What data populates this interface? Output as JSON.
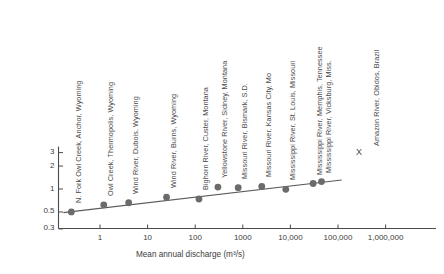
{
  "chart_data": {
    "type": "scatter",
    "title": "",
    "xlabel": "Mean annual discharge (m³/s)",
    "ylabel": "Mean velocity (m/s)",
    "xscale": "log",
    "yscale": "log",
    "xlim": [
      0.15,
      3000000
    ],
    "ylim": [
      0.3,
      3
    ],
    "grid": false,
    "legend_position": "inside-right",
    "xticks": [
      1,
      10,
      100,
      1000,
      10000,
      100000,
      1000000
    ],
    "xticklabels": [
      "1",
      "10",
      "100",
      "1000",
      "10,000",
      "100,000",
      "1,000,000"
    ],
    "yticks": [
      0.3,
      0.5,
      1,
      2,
      3
    ],
    "yticklabels": [
      "0.3",
      "0.5",
      "1",
      "2",
      "3"
    ],
    "marker": "filled-circle",
    "marker_color": "#6b6b6b",
    "line_color": "#5a5a5a",
    "trendline": {
      "label": "fitted power law",
      "x_start": 0.17,
      "y_start": 0.49,
      "x_end": 120000,
      "y_end": 1.31
    },
    "points": [
      {
        "label": "N. Fork Owl Creek, Anchor, Wyoming",
        "x": 0.25,
        "y": 0.5
      },
      {
        "label": "Owl Creek, Thermopolis, Wyoming",
        "x": 1.2,
        "y": 0.62
      },
      {
        "label": "Wind River, Dubois, Wyoming",
        "x": 4.0,
        "y": 0.66
      },
      {
        "label": "Wind River, Burns, Wyoming",
        "x": 25,
        "y": 0.78
      },
      {
        "label": "Bighorn River, Custer, Montana",
        "x": 120,
        "y": 0.74
      },
      {
        "label": "Yellowstone River, Sidney, Montana",
        "x": 300,
        "y": 1.06
      },
      {
        "label": "Missouri River, Bismark, S.D.",
        "x": 800,
        "y": 1.04
      },
      {
        "label": "Missouri River, Kansas City, Mo",
        "x": 2500,
        "y": 1.08
      },
      {
        "label": "Mississippi River, St. Louis, Missouri",
        "x": 8000,
        "y": 0.99
      },
      {
        "label": "Mississippi River, Memphis, Tennessee",
        "x": 30000,
        "y": 1.18
      },
      {
        "label": "Mississippi River, Vicksburg, Miss.",
        "x": 45000,
        "y": 1.25
      }
    ],
    "annotations": [
      {
        "name": "amazon-legend",
        "marker": "X",
        "label": "Amazon River, Obidos, Brazil"
      }
    ]
  },
  "axis": {
    "x_title": "Mean annual discharge (m³/s)",
    "y_title": "Mean velocity (m/s)"
  },
  "legend": {
    "amazon_marker": "X",
    "amazon_label": "Amazon River, Obidos, Brazil"
  }
}
